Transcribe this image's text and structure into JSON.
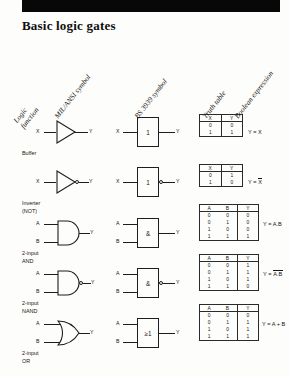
{
  "page": {
    "title": "Basic logic gates",
    "black_bar": "page-top-black-bar"
  },
  "column_headers": [
    {
      "id": "logic-function",
      "line1": "Logic",
      "line2": "function"
    },
    {
      "id": "mil-ansi-symbol",
      "line1": "MIL/ANSI symbol",
      "line2": ""
    },
    {
      "id": "bs-3939-symbol",
      "line1": "BS 3939 symbol",
      "line2": ""
    },
    {
      "id": "truth-table",
      "line1": "Truth table",
      "line2": ""
    },
    {
      "id": "boolean-expression",
      "line1": "Boolean expression",
      "line2": ""
    }
  ],
  "gates": [
    {
      "id": "buffer",
      "name_line1": "Buffer",
      "name_line2": "",
      "mil_inputs": [
        "X"
      ],
      "mil_output": "Y",
      "bs_label": "1",
      "bs_inputs": [
        "X"
      ],
      "bs_output": "Y",
      "inverted": false,
      "truth_headers": [
        "X",
        "Y"
      ],
      "truth_rows": [
        [
          "0",
          "0"
        ],
        [
          "1",
          "1"
        ]
      ],
      "expression_prefix": "Y = ",
      "expression_plain": "X",
      "expression_bar": "",
      "expression_suffix": ""
    },
    {
      "id": "inverter",
      "name_line1": "Inverter",
      "name_line2": "(NOT)",
      "mil_inputs": [
        "X"
      ],
      "mil_output": "Y",
      "bs_label": "1",
      "bs_inputs": [
        "X"
      ],
      "bs_output": "Y",
      "inverted": true,
      "truth_headers": [
        "X",
        "Y"
      ],
      "truth_rows": [
        [
          "0",
          "1"
        ],
        [
          "1",
          "0"
        ]
      ],
      "expression_prefix": "Y = ",
      "expression_plain": "",
      "expression_bar": "X",
      "expression_suffix": ""
    },
    {
      "id": "and-2-input",
      "name_line1": "2-input",
      "name_line2": "AND",
      "mil_inputs": [
        "A",
        "B"
      ],
      "mil_output": "Y",
      "bs_label": "&",
      "bs_inputs": [
        "A",
        "B"
      ],
      "bs_output": "Y",
      "inverted": false,
      "truth_headers": [
        "A",
        "B",
        "Y"
      ],
      "truth_rows": [
        [
          "0",
          "0",
          "0"
        ],
        [
          "0",
          "1",
          "0"
        ],
        [
          "1",
          "0",
          "0"
        ],
        [
          "1",
          "1",
          "1"
        ]
      ],
      "expression_prefix": "Y = ",
      "expression_plain": "A.B",
      "expression_bar": "",
      "expression_suffix": ""
    },
    {
      "id": "nand-2-input",
      "name_line1": "2-input",
      "name_line2": "NAND",
      "mil_inputs": [
        "A",
        "B"
      ],
      "mil_output": "Y",
      "bs_label": "&",
      "bs_inputs": [
        "A",
        "B"
      ],
      "bs_output": "Y",
      "inverted": true,
      "truth_headers": [
        "A",
        "B",
        "Y"
      ],
      "truth_rows": [
        [
          "0",
          "0",
          "1"
        ],
        [
          "0",
          "1",
          "1"
        ],
        [
          "1",
          "0",
          "1"
        ],
        [
          "1",
          "1",
          "0"
        ]
      ],
      "expression_prefix": "Y = ",
      "expression_plain": "",
      "expression_bar": "A.B",
      "expression_suffix": ""
    },
    {
      "id": "or-2-input",
      "name_line1": "2-input",
      "name_line2": "OR",
      "mil_inputs": [
        "A",
        "B"
      ],
      "mil_output": "Y",
      "bs_label": "≥1",
      "bs_inputs": [
        "A",
        "B"
      ],
      "bs_output": "Y",
      "inverted": false,
      "truth_headers": [
        "A",
        "B",
        "Y"
      ],
      "truth_rows": [
        [
          "0",
          "0",
          "0"
        ],
        [
          "0",
          "1",
          "1"
        ],
        [
          "1",
          "0",
          "1"
        ],
        [
          "1",
          "1",
          "1"
        ]
      ],
      "expression_prefix": "Y = ",
      "expression_plain": "A + B",
      "expression_bar": "",
      "expression_suffix": ""
    }
  ],
  "colors": {
    "ink": "#1a1a1a",
    "paper": "#fdfdfb",
    "bar": "#080808"
  }
}
